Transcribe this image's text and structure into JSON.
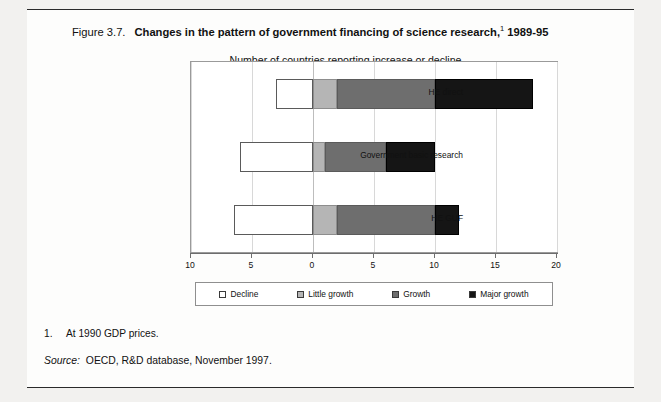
{
  "figure": {
    "number": "Figure 3.7.",
    "title": "Changes in the pattern of government financing of science research,",
    "title_footnote_marker": "1",
    "title_years": " 1989-95",
    "subtitle": "Number of countries reporting increase or decline",
    "footnote_number": "1.",
    "footnote_text": "At 1990 GDP prices.",
    "source_word": "Source:",
    "source_text": "OECD, R&D database, November 1997."
  },
  "legend": {
    "items": [
      {
        "label": "Decline",
        "key": "decline",
        "color": "#ffffff"
      },
      {
        "label": "Little growth",
        "key": "little",
        "color": "#b5b5b5"
      },
      {
        "label": "Growth",
        "key": "growth",
        "color": "#6e6e6e"
      },
      {
        "label": "Major growth",
        "key": "major",
        "color": "#151515"
      }
    ]
  },
  "chart_data": {
    "type": "bar",
    "orientation": "horizontal",
    "stacked": true,
    "subtitle": "Number of countries reporting increase or decline",
    "xlabel": "",
    "ylabel": "",
    "xlim": [
      -10,
      20
    ],
    "xticks": [
      -10,
      -5,
      0,
      5,
      10,
      15,
      20
    ],
    "xticklabels": [
      "10",
      "5",
      "0",
      "5",
      "10",
      "15",
      "20"
    ],
    "grid": true,
    "legend_position": "bottom",
    "categories": [
      "HE direct",
      "Government basic research",
      "HE GUF"
    ],
    "series": [
      {
        "name": "Decline",
        "key": "decline",
        "color": "#ffffff",
        "values": [
          -3,
          -6,
          -6.5
        ]
      },
      {
        "name": "Little growth",
        "key": "little",
        "color": "#b5b5b5",
        "values": [
          2,
          1,
          2
        ]
      },
      {
        "name": "Growth",
        "key": "growth",
        "color": "#6e6e6e",
        "values": [
          8,
          5,
          8
        ]
      },
      {
        "name": "Major growth",
        "key": "major",
        "color": "#151515",
        "values": [
          8,
          4,
          2
        ]
      }
    ],
    "positive_totals": [
      18,
      10,
      12
    ]
  }
}
